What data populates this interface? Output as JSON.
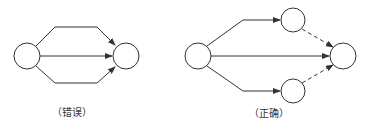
{
  "diagrams": [
    {
      "id": "wrong",
      "caption": "（错误）",
      "nodes": [
        {
          "id": "start",
          "cx": 27,
          "cy": 56,
          "r": 13
        },
        {
          "id": "end",
          "cx": 126,
          "cy": 56,
          "r": 13
        }
      ],
      "edges": [
        {
          "from": "start",
          "to": "end",
          "style": "solid",
          "route": "upper"
        },
        {
          "from": "start",
          "to": "end",
          "style": "solid",
          "route": "straight"
        },
        {
          "from": "start",
          "to": "end",
          "style": "solid",
          "route": "lower"
        }
      ]
    },
    {
      "id": "correct",
      "caption": "（正确）",
      "nodes": [
        {
          "id": "start",
          "cx": 198,
          "cy": 56,
          "r": 13
        },
        {
          "id": "top",
          "cx": 293,
          "cy": 20,
          "r": 12
        },
        {
          "id": "bottom",
          "cx": 293,
          "cy": 91,
          "r": 12
        },
        {
          "id": "end",
          "cx": 343,
          "cy": 56,
          "r": 13
        }
      ],
      "edges": [
        {
          "from": "start",
          "to": "top",
          "style": "solid"
        },
        {
          "from": "start",
          "to": "end",
          "style": "solid"
        },
        {
          "from": "start",
          "to": "bottom",
          "style": "solid"
        },
        {
          "from": "top",
          "to": "end",
          "style": "dashed"
        },
        {
          "from": "bottom",
          "to": "end",
          "style": "dashed"
        }
      ]
    }
  ],
  "colors": {
    "stroke": "#333333",
    "background": "#ffffff"
  }
}
